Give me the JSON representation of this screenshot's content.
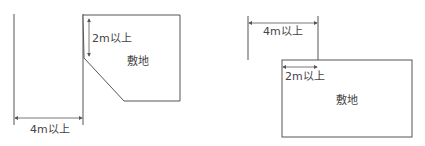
{
  "left_diagram": {
    "label_depth": "2m以上",
    "label_site": "敷地",
    "label_road_width": "4m以上"
  },
  "right_diagram": {
    "label_road_width": "4m以上",
    "label_frontage": "2m以上",
    "label_site": "敷地"
  },
  "colors": {
    "line": "#555555",
    "fill": "#ffffff"
  }
}
